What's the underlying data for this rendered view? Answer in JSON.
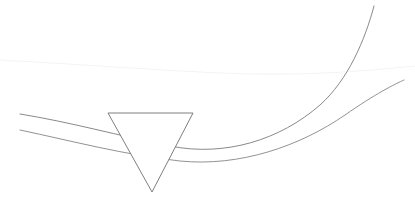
{
  "canvas": {
    "width": 415,
    "height": 201,
    "background_color": "#ffffff",
    "title": "Two sweeping curves intersected by an inverted triangle"
  },
  "palette": {
    "stroke_color": "#7c7c80",
    "stroke_color_secondary": "#868689",
    "faint_stroke_color": "#f4f4f6",
    "triangle_stroke_color": "#6f6f73",
    "triangle_fill_color": "#ffffff"
  },
  "shapes": {
    "curve_upper": {
      "label": "upper-sweeping-curve",
      "stroke": "#7c7c80",
      "stroke_width": 0.9,
      "path": "M 20 114 C 70 122, 120 136, 170 146 C 225 157, 280 140, 320 105 C 348 80, 365 40, 374 6",
      "start_point": [
        20,
        114
      ],
      "end_point": [
        374,
        6
      ]
    },
    "curve_lower": {
      "label": "lower-sweeping-curve",
      "stroke": "#868689",
      "stroke_width": 0.9,
      "path": "M 20 130 C 72 141, 125 155, 180 161 C 240 167, 300 146, 345 115 C 375 94, 395 84, 404 80",
      "start_point": [
        20,
        130
      ],
      "end_point": [
        404,
        80
      ]
    },
    "curve_faint": {
      "label": "faint-upper-curve",
      "stroke": "#f4f4f6",
      "stroke_width": 1.1,
      "path": "M 0 60 C 80 64, 170 72, 250 74 C 310 75, 360 72, 415 66",
      "start_point": [
        0,
        60
      ],
      "end_point": [
        415,
        66
      ]
    },
    "triangle": {
      "label": "inverted-triangle-marker",
      "orientation": "point-down",
      "stroke": "#6f6f73",
      "stroke_width": 0.9,
      "fill": "#ffffff",
      "points": "108,113 193,113 152,192",
      "vertices": [
        [
          108,
          113
        ],
        [
          193,
          113
        ],
        [
          152,
          192
        ]
      ],
      "top_edge_y": 113,
      "apex": [
        152,
        192
      ],
      "width_px": 85,
      "height_px": 79
    }
  }
}
